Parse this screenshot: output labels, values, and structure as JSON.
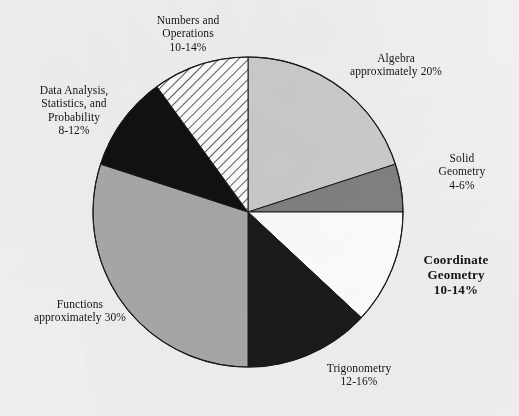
{
  "chart_data": {
    "type": "pie",
    "title": "",
    "subtitle": "",
    "xlabel": "",
    "ylabel": "",
    "legend_position": "callout-labels",
    "grid": false,
    "total": 100,
    "start_angle_deg": 0,
    "direction": "clockwise",
    "categories": [
      "Algebra",
      "Solid Geometry",
      "Coordinate Geometry",
      "Trigonometry",
      "Functions",
      "Data Analysis, Statistics, and Probability",
      "Numbers and Operations"
    ],
    "values": [
      20,
      5,
      12,
      14,
      30,
      10,
      12
    ],
    "slices": [
      {
        "id": "algebra",
        "name": "Algebra",
        "label_lines": [
          "Algebra",
          "approximately 20%"
        ],
        "range_text": "approximately 20%",
        "value": 20,
        "start_deg": 0,
        "end_deg": 72,
        "fill": "#cdcdcd",
        "pattern": "solid",
        "emphasis": false
      },
      {
        "id": "solid-geometry",
        "name": "Solid Geometry",
        "label_lines": [
          "Solid",
          "Geometry",
          "4-6%"
        ],
        "range_text": "4-6%",
        "value": 5,
        "start_deg": 72,
        "end_deg": 90,
        "fill": "#828282",
        "pattern": "solid",
        "emphasis": false
      },
      {
        "id": "coordinate-geometry",
        "name": "Coordinate Geometry",
        "label_lines": [
          "Coordinate",
          "Geometry",
          "10-14%"
        ],
        "range_text": "10-14%",
        "value": 12,
        "start_deg": 90,
        "end_deg": 133,
        "fill": "#ffffff",
        "pattern": "solid",
        "emphasis": true
      },
      {
        "id": "trigonometry",
        "name": "Trigonometry",
        "label_lines": [
          "Trigonometry",
          "12-16%"
        ],
        "range_text": "12-16%",
        "value": 14,
        "start_deg": 133,
        "end_deg": 180,
        "fill": "#1b1b1b",
        "pattern": "solid",
        "emphasis": false
      },
      {
        "id": "functions",
        "name": "Functions",
        "label_lines": [
          "Functions",
          "approximately 30%"
        ],
        "range_text": "approximately 30%",
        "value": 30,
        "start_deg": 180,
        "end_deg": 288,
        "fill": "#a9a9a9",
        "pattern": "solid",
        "emphasis": false
      },
      {
        "id": "data-analysis",
        "name": "Data Analysis, Statistics, and Probability",
        "label_lines": [
          "Data Analysis,",
          "Statistics, and",
          "Probability",
          "8-12%"
        ],
        "range_text": "8-12%",
        "value": 10,
        "start_deg": 288,
        "end_deg": 324,
        "fill": "#111111",
        "pattern": "solid",
        "emphasis": false
      },
      {
        "id": "numbers-operations",
        "name": "Numbers and Operations",
        "label_lines": [
          "Numbers and",
          "Operations",
          "10-14%"
        ],
        "range_text": "10-14%",
        "value": 12,
        "start_deg": 324,
        "end_deg": 360,
        "fill": "#ffffff",
        "pattern": "diagonal-hatch",
        "emphasis": false
      }
    ],
    "geometry": {
      "center_x": 248,
      "center_y": 212,
      "radius": 155,
      "stroke": "#1b1b1b",
      "stroke_width": 1
    },
    "background_color": "#f2f1ef"
  },
  "labels": {
    "numbers_operations": {
      "line1": "Numbers and",
      "line2": "Operations",
      "line3": "10-14%"
    },
    "data_analysis": {
      "line1": "Data Analysis,",
      "line2": "Statistics, and",
      "line3": "Probability",
      "line4": "8-12%"
    },
    "functions": {
      "line1": "Functions",
      "line2": "approximately 30%"
    },
    "algebra": {
      "line1": "Algebra",
      "line2": "approximately 20%"
    },
    "solid_geometry": {
      "line1": "Solid",
      "line2": "Geometry",
      "line3": "4-6%"
    },
    "coordinate_geometry": {
      "line1": "Coordinate",
      "line2": "Geometry",
      "line3": "10-14%"
    },
    "trigonometry": {
      "line1": "Trigonometry",
      "line2": "12-16%"
    }
  }
}
